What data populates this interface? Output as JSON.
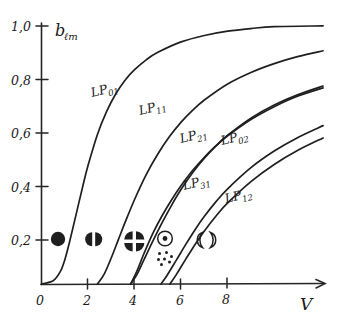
{
  "figure": {
    "y_axis_label_main": "b",
    "y_axis_label_sub": "ℓm",
    "x_axis_label": "V",
    "ink_color": "#1f1f1f"
  },
  "chart_data": {
    "type": "line",
    "title": "",
    "xlabel": "V",
    "ylabel": "bℓm",
    "xlim": [
      0,
      10
    ],
    "ylim": [
      0,
      1.0
    ],
    "xticks": [
      0,
      2,
      4,
      6,
      8
    ],
    "xticklabels": [
      "0",
      "2",
      "4",
      "6",
      "8"
    ],
    "yticks": [
      0.2,
      0.4,
      0.6,
      0.8,
      1.0
    ],
    "yticklabels": [
      "0,2",
      "0,4",
      "0,6",
      "0,8",
      "1,0"
    ],
    "grid": false,
    "legend": "inline-curve-labels",
    "series": [
      {
        "name": "LP01",
        "label": "LP",
        "label_sub": "01",
        "cutoff_V": 0.0,
        "label_pos": {
          "V": 2.35,
          "b": 0.725
        },
        "points": [
          {
            "V": 0.0,
            "b": 0.0
          },
          {
            "V": 0.5,
            "b": 0.012
          },
          {
            "V": 0.8,
            "b": 0.045
          },
          {
            "V": 1.0,
            "b": 0.09
          },
          {
            "V": 1.2,
            "b": 0.155
          },
          {
            "V": 1.5,
            "b": 0.265
          },
          {
            "V": 1.8,
            "b": 0.375
          },
          {
            "V": 2.0,
            "b": 0.443
          },
          {
            "V": 2.4,
            "b": 0.558
          },
          {
            "V": 2.8,
            "b": 0.645
          },
          {
            "V": 3.2,
            "b": 0.712
          },
          {
            "V": 3.6,
            "b": 0.763
          },
          {
            "V": 4.0,
            "b": 0.801
          },
          {
            "V": 4.5,
            "b": 0.838
          },
          {
            "V": 5.0,
            "b": 0.866
          },
          {
            "V": 6.0,
            "b": 0.905
          },
          {
            "V": 7.0,
            "b": 0.929
          },
          {
            "V": 8.0,
            "b": 0.945
          },
          {
            "V": 9.0,
            "b": 0.955
          },
          {
            "V": 10.0,
            "b": 0.962
          },
          {
            "V": 12.1,
            "b": 0.965
          }
        ]
      },
      {
        "name": "LP11",
        "label": "LP",
        "label_sub": "11",
        "cutoff_V": 2.405,
        "label_pos": {
          "V": 4.5,
          "b": 0.645
        },
        "points": [
          {
            "V": 2.405,
            "b": 0.0
          },
          {
            "V": 2.7,
            "b": 0.038
          },
          {
            "V": 3.0,
            "b": 0.098
          },
          {
            "V": 3.3,
            "b": 0.165
          },
          {
            "V": 3.6,
            "b": 0.232
          },
          {
            "V": 4.0,
            "b": 0.316
          },
          {
            "V": 4.5,
            "b": 0.409
          },
          {
            "V": 5.0,
            "b": 0.486
          },
          {
            "V": 5.5,
            "b": 0.551
          },
          {
            "V": 6.0,
            "b": 0.605
          },
          {
            "V": 6.5,
            "b": 0.65
          },
          {
            "V": 7.0,
            "b": 0.688
          },
          {
            "V": 8.0,
            "b": 0.748
          },
          {
            "V": 9.0,
            "b": 0.791
          },
          {
            "V": 10.0,
            "b": 0.824
          },
          {
            "V": 11.0,
            "b": 0.85
          },
          {
            "V": 12.1,
            "b": 0.872
          }
        ]
      },
      {
        "name": "LP21",
        "label": "LP",
        "label_sub": "21",
        "cutoff_V": 3.832,
        "label_pos": {
          "V": 6.35,
          "b": 0.545
        },
        "points": [
          {
            "V": 3.832,
            "b": 0.0
          },
          {
            "V": 4.1,
            "b": 0.035
          },
          {
            "V": 4.4,
            "b": 0.09
          },
          {
            "V": 4.8,
            "b": 0.163
          },
          {
            "V": 5.2,
            "b": 0.232
          },
          {
            "V": 5.6,
            "b": 0.296
          },
          {
            "V": 6.0,
            "b": 0.354
          },
          {
            "V": 6.5,
            "b": 0.417
          },
          {
            "V": 7.0,
            "b": 0.47
          },
          {
            "V": 7.5,
            "b": 0.516
          },
          {
            "V": 8.0,
            "b": 0.556
          },
          {
            "V": 9.0,
            "b": 0.62
          },
          {
            "V": 10.0,
            "b": 0.669
          },
          {
            "V": 11.0,
            "b": 0.707
          },
          {
            "V": 12.1,
            "b": 0.74
          }
        ]
      },
      {
        "name": "LP02",
        "label": "LP",
        "label_sub": "02",
        "cutoff_V": 3.832,
        "label_pos": {
          "V": 8.1,
          "b": 0.535
        },
        "points": [
          {
            "V": 3.832,
            "b": 0.0
          },
          {
            "V": 4.1,
            "b": 0.048
          },
          {
            "V": 4.4,
            "b": 0.113
          },
          {
            "V": 4.8,
            "b": 0.192
          },
          {
            "V": 5.2,
            "b": 0.258
          },
          {
            "V": 5.6,
            "b": 0.316
          },
          {
            "V": 6.0,
            "b": 0.368
          },
          {
            "V": 6.5,
            "b": 0.425
          },
          {
            "V": 7.0,
            "b": 0.474
          },
          {
            "V": 7.5,
            "b": 0.517
          },
          {
            "V": 8.0,
            "b": 0.554
          },
          {
            "V": 9.0,
            "b": 0.615
          },
          {
            "V": 10.0,
            "b": 0.663
          },
          {
            "V": 11.0,
            "b": 0.702
          },
          {
            "V": 12.1,
            "b": 0.733
          }
        ]
      },
      {
        "name": "LP31",
        "label": "LP",
        "label_sub": "31",
        "cutoff_V": 5.136,
        "label_pos": {
          "V": 6.55,
          "b": 0.355
        },
        "points": [
          {
            "V": 5.136,
            "b": 0.0
          },
          {
            "V": 5.4,
            "b": 0.033
          },
          {
            "V": 5.8,
            "b": 0.09
          },
          {
            "V": 6.2,
            "b": 0.148
          },
          {
            "V": 6.6,
            "b": 0.203
          },
          {
            "V": 7.0,
            "b": 0.253
          },
          {
            "V": 7.5,
            "b": 0.308
          },
          {
            "V": 8.0,
            "b": 0.356
          },
          {
            "V": 9.0,
            "b": 0.435
          },
          {
            "V": 10.0,
            "b": 0.497
          },
          {
            "V": 11.0,
            "b": 0.547
          },
          {
            "V": 12.1,
            "b": 0.592
          }
        ]
      },
      {
        "name": "LP12",
        "label": "LP",
        "label_sub": "12",
        "cutoff_V": 5.52,
        "label_pos": {
          "V": 8.3,
          "b": 0.305
        },
        "points": [
          {
            "V": 5.52,
            "b": 0.0
          },
          {
            "V": 5.8,
            "b": 0.036
          },
          {
            "V": 6.2,
            "b": 0.093
          },
          {
            "V": 6.6,
            "b": 0.148
          },
          {
            "V": 7.0,
            "b": 0.198
          },
          {
            "V": 7.5,
            "b": 0.254
          },
          {
            "V": 8.0,
            "b": 0.303
          },
          {
            "V": 9.0,
            "b": 0.383
          },
          {
            "V": 10.0,
            "b": 0.447
          },
          {
            "V": 11.0,
            "b": 0.499
          },
          {
            "V": 12.1,
            "b": 0.546
          }
        ]
      }
    ],
    "mode_pattern_icons": [
      {
        "name": "lp01-mode-pattern-icon",
        "mode": "LP01",
        "V": 1.2,
        "b": 0.2,
        "pattern": "single-filled-lobe"
      },
      {
        "name": "lp11-mode-pattern-icon",
        "mode": "LP11",
        "V": 2.35,
        "b": 0.2,
        "pattern": "two-lobes-vertical-split"
      },
      {
        "name": "lp21-mode-pattern-icon",
        "mode": "LP21",
        "V": 3.95,
        "b": 0.2,
        "pattern": "four-lobes-quartered"
      },
      {
        "name": "lp02-mode-pattern-icon",
        "mode": "LP02",
        "V": 5.05,
        "b": 0.2,
        "pattern": "ring-with-center-dot"
      },
      {
        "name": "lp31-mode-pattern-icon",
        "mode": "LP31",
        "V": 5.1,
        "b": 0.085,
        "pattern": "six-dot-lobes"
      },
      {
        "name": "lp12-mode-pattern-icon",
        "mode": "LP12",
        "V": 6.85,
        "b": 0.18,
        "pattern": "two-crescent-lobes"
      }
    ]
  }
}
